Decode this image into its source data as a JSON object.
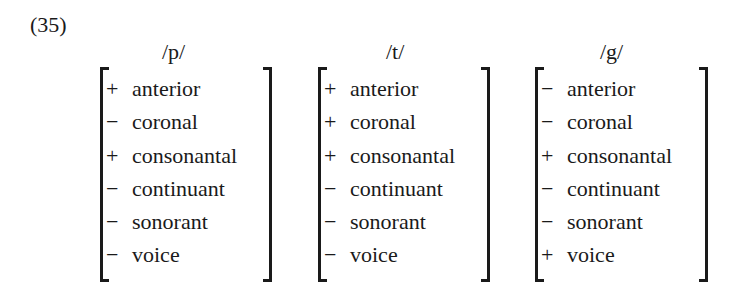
{
  "example_number": "(35)",
  "matrices": [
    {
      "segment": "/p/",
      "features": [
        {
          "sign": "+",
          "name": "anterior"
        },
        {
          "sign": "−",
          "name": "coronal"
        },
        {
          "sign": "+",
          "name": "consonantal"
        },
        {
          "sign": "−",
          "name": "continuant"
        },
        {
          "sign": "−",
          "name": "sonorant"
        },
        {
          "sign": "−",
          "name": "voice"
        }
      ]
    },
    {
      "segment": "/t/",
      "features": [
        {
          "sign": "+",
          "name": "anterior"
        },
        {
          "sign": "+",
          "name": "coronal"
        },
        {
          "sign": "+",
          "name": "consonantal"
        },
        {
          "sign": "−",
          "name": "continuant"
        },
        {
          "sign": "−",
          "name": "sonorant"
        },
        {
          "sign": "−",
          "name": "voice"
        }
      ]
    },
    {
      "segment": "/g/",
      "features": [
        {
          "sign": "−",
          "name": "anterior"
        },
        {
          "sign": "−",
          "name": "coronal"
        },
        {
          "sign": "+",
          "name": "consonantal"
        },
        {
          "sign": "−",
          "name": "continuant"
        },
        {
          "sign": "−",
          "name": "sonorant"
        },
        {
          "sign": "+",
          "name": "voice"
        }
      ]
    }
  ]
}
